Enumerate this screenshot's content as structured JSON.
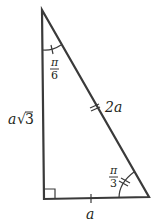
{
  "diagram": {
    "type": "right-triangle",
    "stroke_color": "#3a3a3a",
    "sides": {
      "vertical": "a√3",
      "vertical_prefix": "a",
      "vertical_sqrt": "3",
      "hypotenuse": "2a",
      "base": "a"
    },
    "angles": {
      "top": {
        "numerator": "π",
        "denominator": "6"
      },
      "bottom_right": {
        "numerator": "π",
        "denominator": "3"
      }
    }
  }
}
